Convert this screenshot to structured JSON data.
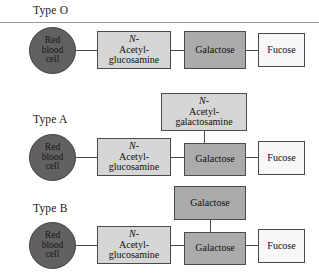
{
  "figure": {
    "divider_color": "#9a9a9a",
    "rows": [
      {
        "type_label": "Type O",
        "cell": {
          "line1": "Red",
          "line2": "blood",
          "line3": "cell"
        },
        "chain": [
          {
            "name_prefix": "N-",
            "name_rest": "Acetyl-",
            "name_line2": "glucosamine",
            "shade": "light"
          },
          {
            "name_prefix": "",
            "name_rest": "Galactose",
            "name_line2": "",
            "shade": "mid"
          },
          {
            "name_prefix": "",
            "name_rest": "Fucose",
            "name_line2": "",
            "shade": "white"
          }
        ],
        "branch": null
      },
      {
        "type_label": "Type A",
        "cell": {
          "line1": "Red",
          "line2": "blood",
          "line3": "cell"
        },
        "chain": [
          {
            "name_prefix": "N-",
            "name_rest": "Acetyl-",
            "name_line2": "glucosamine",
            "shade": "light"
          },
          {
            "name_prefix": "",
            "name_rest": "Galactose",
            "name_line2": "",
            "shade": "mid"
          },
          {
            "name_prefix": "",
            "name_rest": "Fucose",
            "name_line2": "",
            "shade": "white"
          }
        ],
        "branch": {
          "name_prefix": "N-",
          "name_rest": "Acetyl-",
          "name_line2": "galactosamine",
          "shade": "light"
        }
      },
      {
        "type_label": "Type B",
        "cell": {
          "line1": "Red",
          "line2": "blood",
          "line3": "cell"
        },
        "chain": [
          {
            "name_prefix": "N-",
            "name_rest": "Acetyl-",
            "name_line2": "glucosamine",
            "shade": "light"
          },
          {
            "name_prefix": "",
            "name_rest": "Galactose",
            "name_line2": "",
            "shade": "mid"
          },
          {
            "name_prefix": "",
            "name_rest": "Fucose",
            "name_line2": "",
            "shade": "white"
          }
        ],
        "branch": {
          "name_prefix": "",
          "name_rest": "Galactose",
          "name_line2": "",
          "shade": "mid"
        }
      }
    ],
    "colors": {
      "cell_fill": "#616161",
      "shade_light": "#d6d6d6",
      "shade_mid": "#ababab",
      "shade_white": "#f7f7f7",
      "box_border": "#4a4a4a"
    }
  }
}
